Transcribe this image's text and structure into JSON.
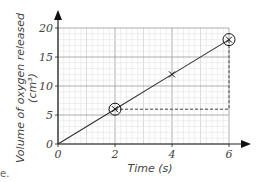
{
  "chart_data": {
    "type": "line",
    "title": "",
    "xlabel": "Time (s)",
    "ylabel": "Volume of oxygen released (cm³)",
    "ylabel_line1": "Volume of oxygen released",
    "ylabel_line2": "(cm³)",
    "xlim": [
      0,
      6
    ],
    "ylim": [
      0,
      20
    ],
    "x_ticks": [
      "0",
      "2",
      "4",
      "6"
    ],
    "y_ticks": [
      "0",
      "5",
      "10",
      "15",
      "20"
    ],
    "grid": true,
    "series": [
      {
        "name": "oxygen volume",
        "x": [
          0,
          2,
          4,
          6
        ],
        "y": [
          0,
          6,
          12,
          18
        ]
      }
    ],
    "markers": [
      {
        "x": 2,
        "y": 6,
        "style": "circled-cross"
      },
      {
        "x": 4,
        "y": 12,
        "style": "cross"
      },
      {
        "x": 6,
        "y": 18,
        "style": "circled-cross"
      }
    ],
    "annotations": [
      {
        "type": "gradient-triangle",
        "from": [
          2,
          6
        ],
        "to": [
          6,
          18
        ],
        "style": "dashed"
      }
    ]
  },
  "fragment_text": "e."
}
